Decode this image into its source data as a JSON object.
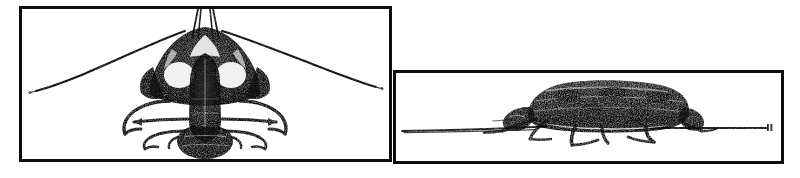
{
  "figure": {
    "background_color": "#ffffff",
    "ink_color": "#0d0d0d",
    "panel_count": 2,
    "style": "halftone line engraving scan",
    "width": 800,
    "height": 178
  },
  "panels": [
    {
      "id": "dorsal-view",
      "name": "Dorsal view panel",
      "label": "",
      "border_color": "#0d0d0d",
      "border_width": 3,
      "x": 19,
      "y": 6,
      "width": 373,
      "height": 156,
      "subject": {
        "name": "beetle-dorsal",
        "orientation": "dorsal",
        "features": [
          "head with mandibles",
          "pair of long sweeping antennae",
          "pronotum",
          "elytra",
          "three pairs of legs",
          "abdomen tip"
        ],
        "antennae": {
          "count": 2,
          "shape": "long arcuate tapering",
          "span_px": 330
        },
        "legs": {
          "count": 6,
          "shape": "curved splayed"
        }
      }
    },
    {
      "id": "lateral-view",
      "name": "Lateral view panel",
      "label": "",
      "border_color": "#0d0d0d",
      "border_width": 3,
      "x": 393,
      "y": 70,
      "width": 391,
      "height": 94,
      "subject": {
        "name": "beetle-lateral",
        "orientation": "lateral",
        "features": [
          "domed elytra",
          "head lowered",
          "legs contacting substrate",
          "ground line"
        ],
        "ground_line": {
          "present": true,
          "description": "horizontal substrate line spanning panel width",
          "end_mark": "small tick at right terminus"
        },
        "legs": {
          "count": 6,
          "shape": "bent walking legs"
        }
      }
    }
  ]
}
